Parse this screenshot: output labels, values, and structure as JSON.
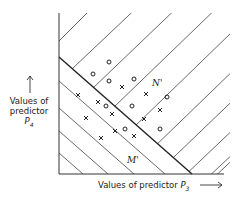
{
  "diagram": {
    "y_axis_label": [
      "Values of",
      "predictor"
    ],
    "y_axis_var": "P",
    "y_axis_sub": "4",
    "x_axis_label": "Values of predictor",
    "x_axis_var": "P",
    "x_axis_sub": "3",
    "region_upper_label": "N'",
    "region_lower_label": "M'",
    "marker_o": "o",
    "marker_x": "x",
    "points_o": [
      [
        109,
        62
      ],
      [
        93,
        74
      ],
      [
        109,
        81
      ],
      [
        134,
        79
      ],
      [
        167,
        97
      ],
      [
        106,
        106
      ],
      [
        132,
        106
      ],
      [
        125,
        129
      ],
      [
        160,
        129
      ]
    ],
    "points_x": [
      [
        78,
        95
      ],
      [
        98,
        102
      ],
      [
        122,
        87
      ],
      [
        146,
        94
      ],
      [
        112,
        114
      ],
      [
        86,
        118
      ],
      [
        160,
        110
      ],
      [
        144,
        119
      ],
      [
        115,
        131
      ],
      [
        101,
        138
      ],
      [
        134,
        136
      ]
    ],
    "colors": {
      "ink": "#222222",
      "background": "#ffffff"
    }
  }
}
